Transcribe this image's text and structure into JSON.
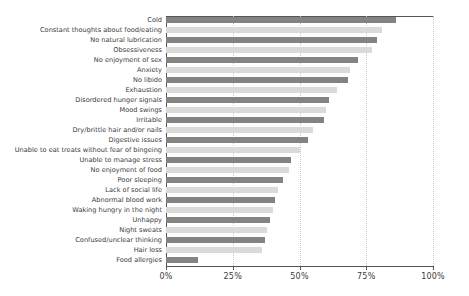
{
  "chart_data": {
    "type": "bar",
    "orientation": "horizontal",
    "title": "",
    "subtitle": "",
    "xlabel": "",
    "ylabel": "",
    "xlim": [
      0,
      100
    ],
    "xtick_labels": [
      "0%",
      "25%",
      "50%",
      "75%",
      "100%"
    ],
    "xticks": [
      0,
      25,
      50,
      75,
      100
    ],
    "grid": "vertical-dotted",
    "legend": "none",
    "categories": [
      "Cold",
      "Constant thoughts about food/eating",
      "No natural lubrication",
      "Obsessiveness",
      "No enjoyment of sex",
      "Anxiety",
      "No libido",
      "Exhaustion",
      "Disordered hunger signals",
      "Mood swings",
      "Irritable",
      "Dry/brittle hair and/or nails",
      "Digestive issues",
      "Unable to eat treats without fear of bingeing",
      "Unable to manage stress",
      "No enjoyment of food",
      "Poor sleeping",
      "Lack of social life",
      "Abnormal blood work",
      "Waking hungry in the night",
      "Unhappy",
      "Night sweats",
      "Confused/unclear thinking",
      "Hair loss",
      "Food allergies"
    ],
    "values": [
      86,
      81,
      79,
      77,
      72,
      69,
      68,
      64,
      61,
      60,
      59,
      55,
      53,
      50,
      47,
      46,
      44,
      42,
      41,
      40,
      39,
      38,
      37,
      36,
      12
    ],
    "bar_colors": [
      "#838383",
      "#dadada",
      "#838383",
      "#dadada",
      "#838383",
      "#dadada",
      "#838383",
      "#dadada",
      "#838383",
      "#dadada",
      "#838383",
      "#dadada",
      "#838383",
      "#dadada",
      "#838383",
      "#dadada",
      "#838383",
      "#dadada",
      "#838383",
      "#dadada",
      "#838383",
      "#dadada",
      "#838383",
      "#dadada",
      "#838383"
    ]
  },
  "colors": {
    "dark_bar": "#838383",
    "light_bar": "#dadada",
    "axis": "#555555",
    "grid": "#c8c8c8",
    "text": "#3a3a3a",
    "background": "#ffffff"
  }
}
